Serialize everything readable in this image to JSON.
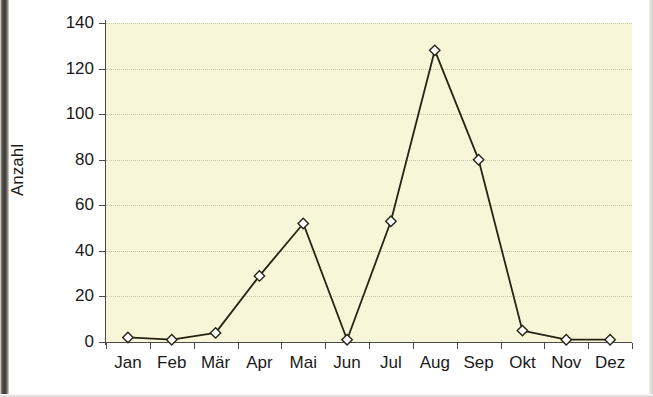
{
  "chart_data": {
    "type": "line",
    "title": "",
    "subtitle": "",
    "xlabel": "",
    "ylabel": "Anzahl",
    "categories": [
      "Jan",
      "Feb",
      "Mär",
      "Apr",
      "Mai",
      "Jun",
      "Jul",
      "Aug",
      "Sep",
      "Okt",
      "Nov",
      "Dez"
    ],
    "values": [
      2,
      1,
      4,
      29,
      52,
      1,
      53,
      128,
      80,
      5,
      1,
      1
    ],
    "series": [
      {
        "name": "Anzahl",
        "values": [
          2,
          1,
          4,
          29,
          52,
          1,
          53,
          128,
          80,
          5,
          1,
          1
        ]
      }
    ],
    "ylim": [
      0,
      140
    ],
    "yticks": [
      0,
      20,
      40,
      60,
      80,
      100,
      120,
      140
    ],
    "ytick_labels": [
      "0",
      "20",
      "40",
      "60",
      "80",
      "100",
      "120",
      "140"
    ],
    "grid": true,
    "grid_style": "dotted-horizontal",
    "legend": "none",
    "legend_position": "none",
    "annotations": [],
    "marker": "diamond-open",
    "colors": {
      "plot_background": "#f7f6d8",
      "line": "#262414",
      "marker_fill": "#ffffff",
      "marker_stroke": "#262414",
      "gridline": "#c9c8a8",
      "axis": "#4a4a48",
      "text": "#1a1a1a",
      "page_background": "#ffffff"
    }
  }
}
